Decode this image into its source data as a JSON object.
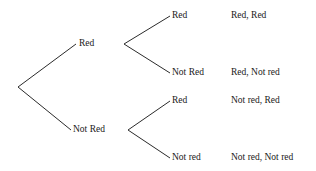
{
  "diagram": {
    "type": "probability-tree",
    "title": "",
    "background_color": "#ffffff",
    "line_color": "#2b2b2b",
    "text_color": "#1a1a1a",
    "root": {
      "label": ""
    },
    "level1": [
      {
        "label": "Red"
      },
      {
        "label": "Not Red"
      }
    ],
    "level2": [
      {
        "label": "Red"
      },
      {
        "label": "Not Red"
      },
      {
        "label": "Red"
      },
      {
        "label": "Not red"
      }
    ],
    "outcomes": [
      {
        "label": "Red, Red"
      },
      {
        "label": "Red, Not red"
      },
      {
        "label": "Not red, Red"
      },
      {
        "label": "Not red, Not red"
      }
    ]
  }
}
